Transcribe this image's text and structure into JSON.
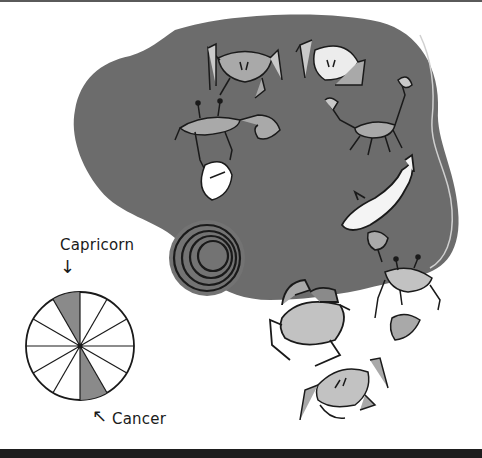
{
  "illustration": {
    "description": "Zodiac illustration: crabs, scorpion, fish and spiral on a grey blob with a zodiac wheel",
    "colors": {
      "blob": "#6c6c6c",
      "crab_fill": "#a9a9a9",
      "crab_light": "#d2d2d2",
      "outline": "#1a1a1a",
      "wheel_highlight": "#8a8a8a",
      "background": "#ffffff",
      "bottom_bar": "#1e1e1e"
    },
    "figures": [
      "crab",
      "crab",
      "crab-with-claw",
      "scorpion",
      "fish",
      "spiral",
      "crab",
      "crab",
      "crab"
    ]
  },
  "zodiac_wheel": {
    "segments": 12,
    "highlighted": [
      "Capricorn",
      "Cancer"
    ],
    "labels": {
      "capricorn": "Capricorn",
      "cancer": "Cancer"
    },
    "arrows": {
      "capricorn": "↓",
      "cancer": "↖"
    }
  }
}
